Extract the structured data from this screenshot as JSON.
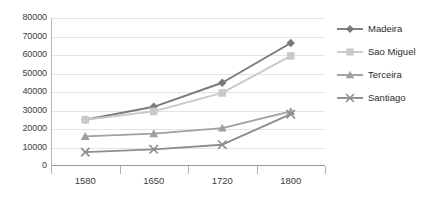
{
  "chart_data": {
    "type": "line",
    "title": "",
    "subtitle": "",
    "xlabel": "",
    "ylabel": "",
    "categories": [
      "1580",
      "1650",
      "1720",
      "1800"
    ],
    "ylim": [
      0,
      80000
    ],
    "yticks": [
      "0",
      "10000",
      "20000",
      "30000",
      "40000",
      "50000",
      "60000",
      "70000",
      "80000"
    ],
    "ytick_values": [
      0,
      10000,
      20000,
      30000,
      40000,
      50000,
      60000,
      70000,
      80000
    ],
    "grid": true,
    "legend_position": "right",
    "series": [
      {
        "name": "Madeira",
        "marker": "diamond",
        "color": "#7a7a7a",
        "values": [
          25000,
          32000,
          45000,
          66500
        ]
      },
      {
        "name": "Sao Miguel",
        "marker": "square",
        "color": "#c9c9c9",
        "values": [
          25000,
          29500,
          39500,
          59500
        ]
      },
      {
        "name": "Terceira",
        "marker": "triangle",
        "color": "#a0a0a0",
        "values": [
          16000,
          17500,
          20500,
          29500
        ]
      },
      {
        "name": "Santiago",
        "marker": "cross",
        "color": "#8d8d8d",
        "values": [
          7500,
          9000,
          11500,
          28000
        ]
      }
    ]
  },
  "legend": {
    "items": [
      {
        "label": "Madeira"
      },
      {
        "label": "Sao Miguel"
      },
      {
        "label": "Terceira"
      },
      {
        "label": "Santiago"
      }
    ]
  }
}
